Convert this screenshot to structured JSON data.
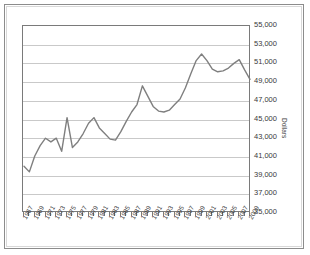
{
  "chart_data": {
    "type": "line",
    "title": "",
    "subtitle": "",
    "xlabel": "",
    "ylabel": "Dollars",
    "ylim": [
      35000,
      55000
    ],
    "ytick_step": 2000,
    "ytick_labels": [
      "55,000",
      "53,000",
      "51,000",
      "49,000",
      "47,000",
      "45,000",
      "43,000",
      "41,000",
      "39,000",
      "37,000",
      "35,000"
    ],
    "ytick_values": [
      55000,
      53000,
      51000,
      49000,
      47000,
      45000,
      43000,
      41000,
      39000,
      37000,
      35000
    ],
    "grid": true,
    "legend": "none",
    "xtick_labels": [
      "1967",
      "1969",
      "1971",
      "1973",
      "1975",
      "1977",
      "1979",
      "1981",
      "1983",
      "1985",
      "1987",
      "1989",
      "1991",
      "1993",
      "1995",
      "1997",
      "1999",
      "2001",
      "2003",
      "2005",
      "2007",
      "2009"
    ],
    "x": [
      1967,
      1968,
      1969,
      1970,
      1971,
      1972,
      1973,
      1974,
      1975,
      1976,
      1977,
      1978,
      1979,
      1980,
      1981,
      1982,
      1983,
      1984,
      1985,
      1986,
      1987,
      1988,
      1989,
      1990,
      1991,
      1992,
      1993,
      1994,
      1995,
      1996,
      1997,
      1998,
      1999,
      2000,
      2001,
      2002,
      2003,
      2004,
      2005,
      2006,
      2007,
      2008,
      2009
    ],
    "series": [
      {
        "name": "Median household income",
        "color": "#7f7f7f",
        "values": [
          40000,
          39400,
          41100,
          42200,
          43000,
          42600,
          43000,
          41600,
          45200,
          42000,
          42600,
          43500,
          44600,
          45200,
          44100,
          43500,
          42900,
          42800,
          43700,
          44800,
          45800,
          46600,
          48600,
          47500,
          46400,
          45900,
          45800,
          46000,
          46600,
          47200,
          48400,
          49900,
          51300,
          52000,
          51300,
          50400,
          50100,
          50200,
          50500,
          51000,
          51400,
          50300,
          49300
        ]
      }
    ]
  },
  "axes": {
    "y_title": "Dollars"
  }
}
